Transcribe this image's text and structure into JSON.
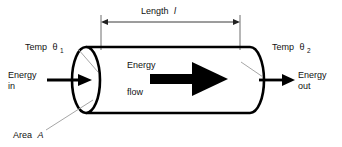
{
  "figure": {
    "background_color": "#ffffff",
    "ink_color": "#111111",
    "leader_color": "#9a9a9a"
  },
  "labels": {
    "length": {
      "text": "Length",
      "symbol": "l"
    },
    "temp_left": {
      "text": "Temp",
      "symbol": "θ",
      "subscript": "1"
    },
    "temp_right": {
      "text": "Temp",
      "symbol": "θ",
      "subscript": "2"
    },
    "energy_in": {
      "line1": "Energy",
      "line2": "in"
    },
    "energy_out": {
      "line1": "Energy",
      "line2": "out"
    },
    "energy_flow": {
      "line1": "Energy",
      "line2": "flow"
    },
    "area": {
      "text": "Area",
      "symbol": "A"
    }
  }
}
